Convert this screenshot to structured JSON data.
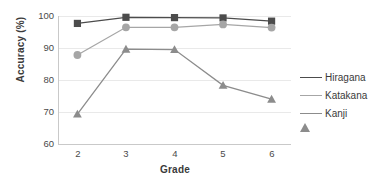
{
  "chart_data": {
    "type": "line",
    "title": "",
    "xlabel": "Grade",
    "ylabel": "Accuracy (%)",
    "categories": [
      "2",
      "3",
      "4",
      "5",
      "6"
    ],
    "x": [
      2,
      3,
      4,
      5,
      6
    ],
    "xlim": [
      1.6,
      6.4
    ],
    "ylim": [
      60,
      100
    ],
    "yticks": [
      60,
      70,
      80,
      90,
      100
    ],
    "xticks": [
      2,
      3,
      4,
      5,
      6
    ],
    "grid": "horizontal",
    "legend_position": "right",
    "series": [
      {
        "name": "Hiragana",
        "marker": "square",
        "color": "#4c4c4c",
        "values": [
          97.7,
          99.6,
          99.5,
          99.4,
          98.4
        ]
      },
      {
        "name": "Katakana",
        "marker": "circle",
        "color": "#a6a6a6",
        "values": [
          87.9,
          96.5,
          96.5,
          97.4,
          96.4
        ]
      },
      {
        "name": "Kanji",
        "marker": "triangle",
        "color": "#8c8c8c",
        "values": [
          69.6,
          89.7,
          89.6,
          78.5,
          74.2
        ]
      }
    ]
  },
  "axes": {
    "ylabel_text": "Accuracy (%)",
    "xlabel_text": "Grade",
    "ytick_labels": [
      "100",
      "90",
      "80",
      "70",
      "60"
    ],
    "xtick_labels": [
      "2",
      "3",
      "4",
      "5",
      "6"
    ]
  },
  "legend": {
    "items": [
      {
        "label": "Hiragana",
        "color": "#4c4c4c",
        "marker": "square"
      },
      {
        "label": "Katakana",
        "color": "#a6a6a6",
        "marker": "circle"
      },
      {
        "label": "Kanji",
        "color": "#8c8c8c",
        "marker": "triangle"
      }
    ]
  },
  "colors": {
    "background": "#ffffff",
    "grid": "#e9e9e9",
    "axis": "#c9c9c9",
    "text": "#3a3a3a"
  }
}
